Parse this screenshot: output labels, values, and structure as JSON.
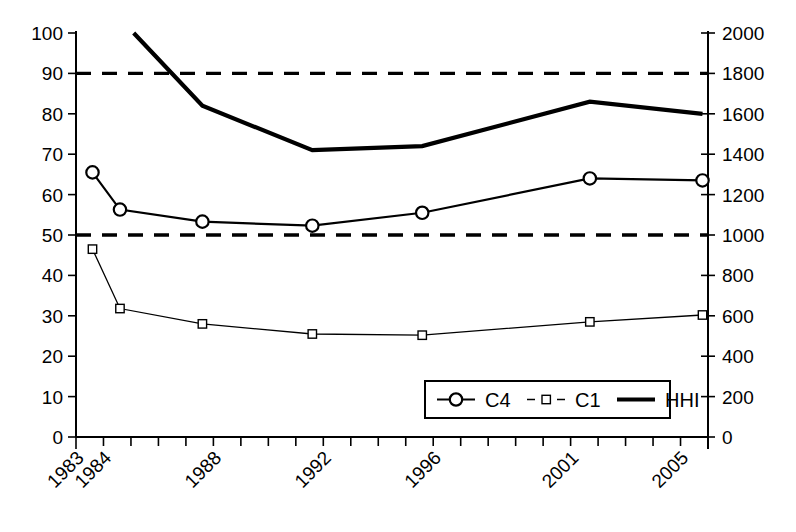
{
  "chart_data": {
    "type": "line",
    "title": "",
    "xlabel": "",
    "ylabel": "",
    "y2label": "",
    "grid": false,
    "legend_position": "inside-bottom-right",
    "x": [
      1983.6,
      1984.6,
      1987.6,
      1991.6,
      1995.6,
      2001.7,
      2005.8
    ],
    "x_axis": {
      "min": 1983,
      "max": 2006,
      "tick_step": 1,
      "labeled_ticks": [
        "1983",
        "1984",
        "1988",
        "1992",
        "1996",
        "2001",
        "2005"
      ],
      "labeled_tick_years": [
        1983,
        1984,
        1988,
        1992,
        1996,
        2001,
        2005
      ],
      "label_rotation_deg": -45
    },
    "y_axis_left": {
      "min": 0,
      "max": 100,
      "tick_step": 10,
      "tick_labels": [
        "0",
        "10",
        "20",
        "30",
        "40",
        "50",
        "60",
        "70",
        "80",
        "90",
        "100"
      ]
    },
    "y_axis_right": {
      "min": 0,
      "max": 2000,
      "tick_step": 200,
      "tick_labels": [
        "0",
        "200",
        "400",
        "600",
        "800",
        "1000",
        "1200",
        "1400",
        "1600",
        "1800",
        "2000"
      ]
    },
    "series": [
      {
        "name": "C4",
        "axis": "left",
        "marker": "circle",
        "line_width": "thin",
        "values": [
          65.5,
          56.3,
          53.3,
          52.3,
          55.5,
          64.0,
          63.5
        ]
      },
      {
        "name": "C1",
        "axis": "left",
        "marker": "square",
        "line_width": "hairline",
        "values": [
          46.5,
          31.8,
          28.0,
          25.5,
          25.2,
          28.5,
          30.2
        ]
      },
      {
        "name": "HHI",
        "axis": "right",
        "marker": "none",
        "line_width": "thick",
        "x": [
          1985.1,
          1987.6,
          1991.6,
          1995.6,
          2001.7,
          2005.8
        ],
        "values": [
          2000,
          1640,
          1420,
          1440,
          1660,
          1600
        ],
        "values_left_scale": [
          100,
          82,
          71,
          72,
          83,
          80
        ]
      }
    ],
    "reference_lines": [
      {
        "name": "upper-threshold",
        "axis": "left",
        "value": 90,
        "value_right": 1800,
        "style": "dashed"
      },
      {
        "name": "lower-threshold",
        "axis": "left",
        "value": 50,
        "value_right": 1000,
        "style": "dashed"
      }
    ],
    "legend": [
      {
        "label": "C4",
        "marker": "circle"
      },
      {
        "label": "C1",
        "marker": "square"
      },
      {
        "label": "HHI",
        "marker": "line"
      }
    ]
  }
}
